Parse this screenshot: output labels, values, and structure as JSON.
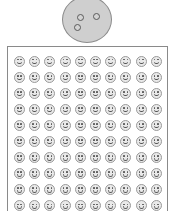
{
  "figure": {
    "background_color": "#ffffff",
    "magnified_specimen": {
      "shape": "circle",
      "fill_color": "#cfcfcf",
      "stroke_color": "#8c8c8c",
      "dot_count": 3,
      "dot_fill_color": "#d4d4d4",
      "dot_stroke_color": "#5a5a5a",
      "dots": [
        {
          "name": "dot-upper-left",
          "x": 15,
          "y": 18
        },
        {
          "name": "dot-upper-right",
          "x": 31,
          "y": 17
        },
        {
          "name": "dot-lower-left",
          "x": 12,
          "y": 28
        }
      ]
    },
    "panel": {
      "border_color": "#8a8a8a",
      "fill_color": "#ffffff",
      "grid": {
        "columns": 10,
        "rows": 10,
        "total_items": 100,
        "item_shape": "smiley-face",
        "item_fill_color": "#e9e9e9",
        "item_stroke_color": "#9a9a9a",
        "feature_color": "#555555",
        "items": [
          "face",
          "face",
          "face",
          "face",
          "face",
          "face",
          "face",
          "face",
          "face",
          "face",
          "face",
          "face",
          "face",
          "face",
          "face",
          "face",
          "face",
          "face",
          "face",
          "face",
          "face",
          "face",
          "face",
          "face",
          "face",
          "face",
          "face",
          "face",
          "face",
          "face",
          "face",
          "face",
          "face",
          "face",
          "face",
          "face",
          "face",
          "face",
          "face",
          "face",
          "face",
          "face",
          "face",
          "face",
          "face",
          "face",
          "face",
          "face",
          "face",
          "face",
          "face",
          "face",
          "face",
          "face",
          "face",
          "face",
          "face",
          "face",
          "face",
          "face",
          "face",
          "face",
          "face",
          "face",
          "face",
          "face",
          "face",
          "face",
          "face",
          "face",
          "face",
          "face",
          "face",
          "face",
          "face",
          "face",
          "face",
          "face",
          "face",
          "face",
          "face",
          "face",
          "face",
          "face",
          "face",
          "face",
          "face",
          "face",
          "face",
          "face",
          "face",
          "face",
          "face",
          "face",
          "face",
          "face",
          "face",
          "face",
          "face",
          "face"
        ]
      }
    }
  }
}
